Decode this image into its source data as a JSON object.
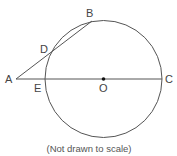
{
  "figure": {
    "caption": "(Not drawn to scale)",
    "points": {
      "A": {
        "label": "A"
      },
      "B": {
        "label": "B"
      },
      "C": {
        "label": "C"
      },
      "D": {
        "label": "D"
      },
      "E": {
        "label": "E"
      },
      "O": {
        "label": "O"
      }
    },
    "elements": [
      "circle centered at O",
      "segment AC through E and O (diameter EC extended to A)",
      "secant from A through D to B",
      "chord DB"
    ],
    "colors": {
      "stroke": "#555555",
      "center_dot": "#111111",
      "text": "#444444"
    }
  }
}
